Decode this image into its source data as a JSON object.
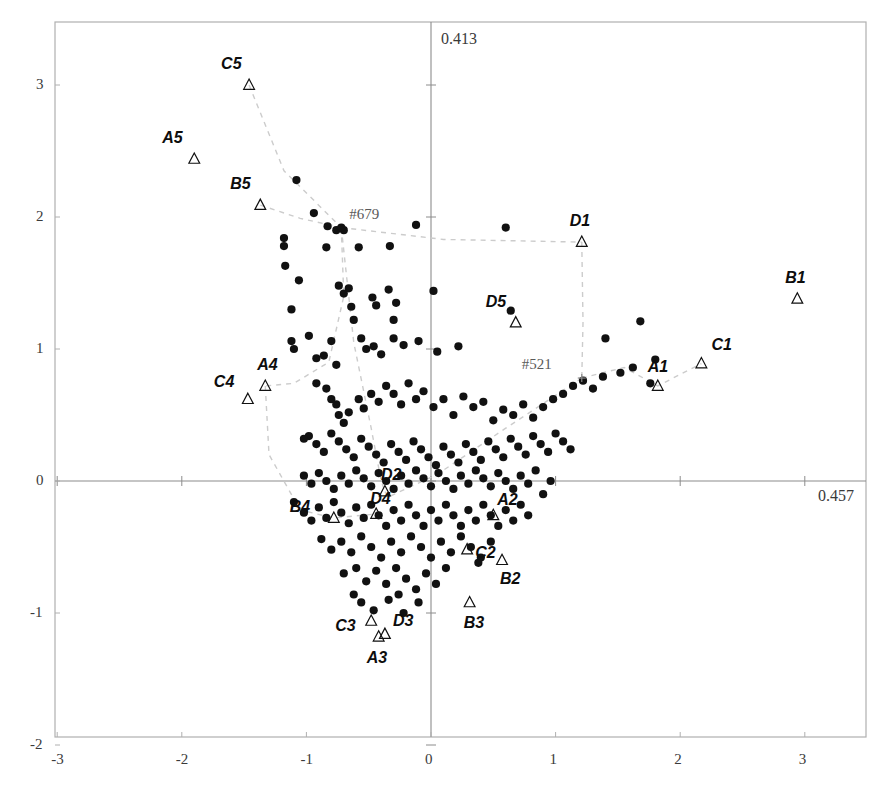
{
  "chart_data": {
    "type": "scatter",
    "title": "",
    "xlabel": "",
    "ylabel": "",
    "xlim": [
      -3.0,
      3.3
    ],
    "ylim": [
      -2.0,
      3.45
    ],
    "grid": false,
    "legend": "none",
    "axis_annotations": {
      "vertical_axis_value": "0.413",
      "horizontal_axis_value": "0.457"
    },
    "xticks": [
      -3,
      -2,
      -1,
      0,
      1,
      2,
      3
    ],
    "xticklabels": [
      "-3",
      "-2",
      "-1",
      "0",
      "1",
      "2",
      "3"
    ],
    "yticks": [
      -2,
      -1,
      0,
      1,
      2,
      3
    ],
    "yticklabels": [
      "-2",
      "-1",
      "0",
      "1",
      "2",
      "3"
    ],
    "series": [
      {
        "name": "observations",
        "marker": "filled-circle",
        "color": "#111111",
        "points": [
          [
            -1.08,
            2.28
          ],
          [
            -0.94,
            2.03
          ],
          [
            -1.18,
            1.84
          ],
          [
            -1.18,
            1.78
          ],
          [
            -1.17,
            1.63
          ],
          [
            -0.83,
            1.93
          ],
          [
            -0.76,
            1.9
          ],
          [
            -0.7,
            1.9
          ],
          [
            -1.06,
            1.52
          ],
          [
            -1.12,
            1.3
          ],
          [
            -0.84,
            1.77
          ],
          [
            -0.58,
            1.77
          ],
          [
            -0.33,
            1.78
          ],
          [
            -0.12,
            1.94
          ],
          [
            0.6,
            1.92
          ],
          [
            -0.74,
            1.48
          ],
          [
            -0.7,
            1.42
          ],
          [
            -0.66,
            1.46
          ],
          [
            -0.64,
            1.32
          ],
          [
            -0.62,
            1.22
          ],
          [
            -0.47,
            1.39
          ],
          [
            -0.44,
            1.33
          ],
          [
            -0.34,
            1.45
          ],
          [
            -0.28,
            1.35
          ],
          [
            -1.12,
            1.06
          ],
          [
            -1.1,
            1.0
          ],
          [
            -0.98,
            1.1
          ],
          [
            -0.92,
            0.93
          ],
          [
            -0.86,
            0.95
          ],
          [
            -0.8,
            1.06
          ],
          [
            -0.76,
            0.88
          ],
          [
            -0.56,
            1.08
          ],
          [
            -0.52,
            1.0
          ],
          [
            -0.46,
            1.02
          ],
          [
            -0.4,
            0.96
          ],
          [
            -0.3,
            1.08
          ],
          [
            -0.22,
            1.03
          ],
          [
            -0.1,
            1.06
          ],
          [
            0.05,
            0.98
          ],
          [
            0.22,
            1.02
          ],
          [
            0.64,
            1.29
          ],
          [
            1.4,
            1.08
          ],
          [
            1.68,
            1.21
          ],
          [
            1.8,
            0.92
          ],
          [
            1.62,
            0.86
          ],
          [
            1.52,
            0.82
          ],
          [
            1.38,
            0.79
          ],
          [
            1.76,
            0.74
          ],
          [
            -0.92,
            0.74
          ],
          [
            -0.84,
            0.7
          ],
          [
            -0.8,
            0.62
          ],
          [
            -0.76,
            0.58
          ],
          [
            -0.74,
            0.5
          ],
          [
            -0.7,
            0.44
          ],
          [
            -0.66,
            0.52
          ],
          [
            -0.58,
            0.62
          ],
          [
            -0.54,
            0.55
          ],
          [
            -0.48,
            0.66
          ],
          [
            -0.42,
            0.6
          ],
          [
            -0.36,
            0.72
          ],
          [
            -0.3,
            0.66
          ],
          [
            -0.24,
            0.58
          ],
          [
            -0.18,
            0.74
          ],
          [
            -0.12,
            0.62
          ],
          [
            -0.06,
            0.68
          ],
          [
            0.02,
            0.56
          ],
          [
            0.1,
            0.62
          ],
          [
            0.18,
            0.5
          ],
          [
            0.26,
            0.64
          ],
          [
            0.34,
            0.56
          ],
          [
            0.42,
            0.6
          ],
          [
            0.5,
            0.46
          ],
          [
            0.58,
            0.54
          ],
          [
            0.66,
            0.5
          ],
          [
            0.74,
            0.58
          ],
          [
            0.82,
            0.48
          ],
          [
            0.9,
            0.56
          ],
          [
            0.98,
            0.62
          ],
          [
            1.06,
            0.66
          ],
          [
            1.14,
            0.72
          ],
          [
            1.22,
            0.76
          ],
          [
            1.3,
            0.7
          ],
          [
            -0.98,
            0.34
          ],
          [
            -0.92,
            0.28
          ],
          [
            -0.86,
            0.22
          ],
          [
            -0.8,
            0.36
          ],
          [
            -0.74,
            0.3
          ],
          [
            -0.68,
            0.24
          ],
          [
            -0.62,
            0.18
          ],
          [
            -0.56,
            0.32
          ],
          [
            -0.5,
            0.26
          ],
          [
            -0.44,
            0.2
          ],
          [
            -0.38,
            0.14
          ],
          [
            -0.32,
            0.28
          ],
          [
            -0.26,
            0.22
          ],
          [
            -0.2,
            0.16
          ],
          [
            -0.14,
            0.3
          ],
          [
            -0.08,
            0.24
          ],
          [
            -0.02,
            0.18
          ],
          [
            0.04,
            0.12
          ],
          [
            0.1,
            0.26
          ],
          [
            0.16,
            0.2
          ],
          [
            0.22,
            0.14
          ],
          [
            0.28,
            0.28
          ],
          [
            0.34,
            0.22
          ],
          [
            0.4,
            0.16
          ],
          [
            0.46,
            0.3
          ],
          [
            0.52,
            0.24
          ],
          [
            0.58,
            0.18
          ],
          [
            0.64,
            0.32
          ],
          [
            0.7,
            0.26
          ],
          [
            0.76,
            0.2
          ],
          [
            0.82,
            0.34
          ],
          [
            0.88,
            0.28
          ],
          [
            0.94,
            0.22
          ],
          [
            1.0,
            0.36
          ],
          [
            1.06,
            0.3
          ],
          [
            1.12,
            0.24
          ],
          [
            -1.02,
            0.04
          ],
          [
            -0.96,
            -0.02
          ],
          [
            -0.9,
            0.06
          ],
          [
            -0.84,
            0.0
          ],
          [
            -0.78,
            -0.06
          ],
          [
            -0.72,
            0.04
          ],
          [
            -0.66,
            -0.02
          ],
          [
            -0.6,
            0.08
          ],
          [
            -0.54,
            0.02
          ],
          [
            -0.48,
            -0.04
          ],
          [
            -0.42,
            0.06
          ],
          [
            -0.36,
            0.0
          ],
          [
            -0.3,
            -0.06
          ],
          [
            -0.24,
            0.04
          ],
          [
            -0.18,
            -0.02
          ],
          [
            -0.12,
            0.08
          ],
          [
            -0.06,
            0.02
          ],
          [
            0.0,
            -0.04
          ],
          [
            0.06,
            0.06
          ],
          [
            0.12,
            0.0
          ],
          [
            0.18,
            -0.06
          ],
          [
            0.24,
            0.04
          ],
          [
            0.3,
            -0.02
          ],
          [
            0.36,
            0.08
          ],
          [
            0.42,
            0.02
          ],
          [
            0.48,
            -0.04
          ],
          [
            0.54,
            0.06
          ],
          [
            0.6,
            0.0
          ],
          [
            0.66,
            -0.06
          ],
          [
            0.72,
            0.04
          ],
          [
            0.78,
            -0.02
          ],
          [
            0.84,
            0.08
          ],
          [
            0.9,
            -0.1
          ],
          [
            0.96,
            0.0
          ],
          [
            -1.1,
            -0.16
          ],
          [
            -1.02,
            -0.24
          ],
          [
            -0.96,
            -0.3
          ],
          [
            -0.9,
            -0.2
          ],
          [
            -0.84,
            -0.28
          ],
          [
            -0.78,
            -0.16
          ],
          [
            -0.72,
            -0.24
          ],
          [
            -0.66,
            -0.32
          ],
          [
            -0.6,
            -0.2
          ],
          [
            -0.54,
            -0.28
          ],
          [
            -0.48,
            -0.18
          ],
          [
            -0.42,
            -0.26
          ],
          [
            -0.36,
            -0.34
          ],
          [
            -0.3,
            -0.22
          ],
          [
            -0.24,
            -0.3
          ],
          [
            -0.18,
            -0.18
          ],
          [
            -0.12,
            -0.26
          ],
          [
            -0.06,
            -0.34
          ],
          [
            0.0,
            -0.22
          ],
          [
            0.06,
            -0.3
          ],
          [
            0.12,
            -0.18
          ],
          [
            0.18,
            -0.26
          ],
          [
            0.24,
            -0.34
          ],
          [
            0.3,
            -0.22
          ],
          [
            0.36,
            -0.3
          ],
          [
            0.42,
            -0.18
          ],
          [
            0.48,
            -0.26
          ],
          [
            0.54,
            -0.34
          ],
          [
            0.6,
            -0.22
          ],
          [
            0.66,
            -0.3
          ],
          [
            0.72,
            -0.18
          ],
          [
            0.78,
            -0.26
          ],
          [
            -0.88,
            -0.44
          ],
          [
            -0.8,
            -0.52
          ],
          [
            -0.72,
            -0.46
          ],
          [
            -0.64,
            -0.54
          ],
          [
            -0.56,
            -0.42
          ],
          [
            -0.48,
            -0.5
          ],
          [
            -0.4,
            -0.58
          ],
          [
            -0.32,
            -0.46
          ],
          [
            -0.24,
            -0.54
          ],
          [
            -0.16,
            -0.42
          ],
          [
            -0.08,
            -0.5
          ],
          [
            0.0,
            -0.58
          ],
          [
            0.08,
            -0.46
          ],
          [
            0.16,
            -0.54
          ],
          [
            0.24,
            -0.42
          ],
          [
            0.32,
            -0.5
          ],
          [
            0.4,
            -0.58
          ],
          [
            0.48,
            -0.46
          ],
          [
            -0.7,
            -0.7
          ],
          [
            -0.6,
            -0.66
          ],
          [
            -0.52,
            -0.76
          ],
          [
            -0.44,
            -0.68
          ],
          [
            -0.36,
            -0.78
          ],
          [
            -0.28,
            -0.66
          ],
          [
            -0.2,
            -0.74
          ],
          [
            -0.12,
            -0.82
          ],
          [
            -0.04,
            -0.7
          ],
          [
            0.04,
            -0.78
          ],
          [
            0.12,
            -0.66
          ],
          [
            -0.56,
            -0.92
          ],
          [
            -0.46,
            -0.98
          ],
          [
            -0.34,
            -0.9
          ],
          [
            -0.22,
            -1.0
          ],
          [
            -0.1,
            -0.92
          ],
          [
            -0.62,
            -0.86
          ],
          [
            -0.26,
            -0.86
          ],
          [
            0.38,
            -0.62
          ],
          [
            -1.02,
            0.32
          ],
          [
            -0.3,
            1.22
          ],
          [
            0.02,
            1.44
          ]
        ]
      },
      {
        "name": "group-centroids",
        "marker": "open-triangle",
        "color": "#111111",
        "points": [
          {
            "label": "C5",
            "x": -1.46,
            "y": 3.0
          },
          {
            "label": "A5",
            "x": -1.9,
            "y": 2.44
          },
          {
            "label": "B5",
            "x": -1.37,
            "y": 2.09
          },
          {
            "label": "D1",
            "x": 1.21,
            "y": 1.81
          },
          {
            "label": "B1",
            "x": 2.94,
            "y": 1.38
          },
          {
            "label": "D5",
            "x": 0.68,
            "y": 1.2
          },
          {
            "label": "C1",
            "x": 2.17,
            "y": 0.89
          },
          {
            "label": "A1",
            "x": 1.82,
            "y": 0.72
          },
          {
            "label": "A4",
            "x": -1.33,
            "y": 0.72
          },
          {
            "label": "C4",
            "x": -1.47,
            "y": 0.62
          },
          {
            "label": "D2",
            "x": -0.37,
            "y": -0.08
          },
          {
            "label": "D4",
            "x": -0.44,
            "y": -0.25
          },
          {
            "label": "B4",
            "x": -0.78,
            "y": -0.28
          },
          {
            "label": "A2",
            "x": 0.5,
            "y": -0.26
          },
          {
            "label": "C2",
            "x": 0.29,
            "y": -0.52
          },
          {
            "label": "B2",
            "x": 0.57,
            "y": -0.6
          },
          {
            "label": "B3",
            "x": 0.31,
            "y": -0.92
          },
          {
            "label": "C3",
            "x": -0.48,
            "y": -1.06
          },
          {
            "label": "D3",
            "x": -0.37,
            "y": -1.16
          },
          {
            "label": "A3",
            "x": -0.42,
            "y": -1.18
          }
        ]
      }
    ],
    "node_markers": [
      {
        "label": "#679",
        "x": -0.72,
        "y": 1.92,
        "marker": "filled-circle"
      },
      {
        "label": "#521",
        "x": 1.21,
        "y": 0.78,
        "marker": "small-cross"
      }
    ],
    "connector_paths": [
      {
        "from": "C5",
        "to": "#679"
      },
      {
        "from": "B5",
        "to": "#679"
      },
      {
        "from": "#679",
        "to": "D1"
      },
      {
        "from": "#679",
        "to": "branch-left-lower"
      },
      {
        "from": "D1",
        "to": "#521"
      },
      {
        "from": "#521",
        "to": "A1"
      },
      {
        "from": "#521",
        "to": "center-cloud"
      }
    ]
  },
  "ticks": {
    "x": [
      {
        "label": "-3",
        "value": -3
      },
      {
        "label": "-2",
        "value": -2
      },
      {
        "label": "-1",
        "value": -1
      },
      {
        "label": "0",
        "value": 0
      },
      {
        "label": "1",
        "value": 1
      },
      {
        "label": "2",
        "value": 2
      },
      {
        "label": "3",
        "value": 3
      }
    ],
    "y": [
      {
        "label": "3",
        "value": 3
      },
      {
        "label": "2",
        "value": 2
      },
      {
        "label": "1",
        "value": 1
      },
      {
        "label": "0",
        "value": 0
      },
      {
        "label": "-1",
        "value": -1
      },
      {
        "label": "-2",
        "value": -2
      }
    ]
  },
  "annotations": {
    "vertical_axis_label": "0.413",
    "horizontal_axis_label": "0.457"
  },
  "colors": {
    "marker": "#111111",
    "axis": "#8c8c8c",
    "frame": "#b0b0b0",
    "dashed": "#cccccc",
    "text": "#3a3a3a"
  }
}
